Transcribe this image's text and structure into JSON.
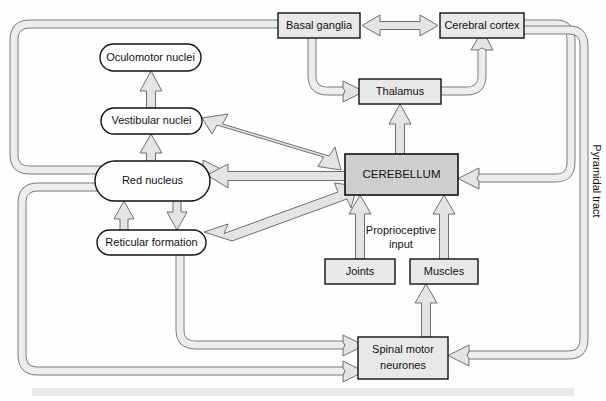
{
  "diagram": {
    "background": "#fefefe",
    "bottom_band_color": "#e9e9e9",
    "node_fill_box": "#e8e8e8",
    "node_fill_oval": "#fefefe",
    "cerebellum_fill": "#d0d0d0",
    "arrow_fill": "#e0e0e0",
    "arrow_stroke": "#6b6b6b",
    "stroke": "#1a1a1a"
  },
  "nodes": {
    "basal_ganglia": {
      "label": "Basal ganglia",
      "shape": "rect",
      "x": 278,
      "y": 13,
      "w": 82,
      "h": 25
    },
    "cerebral_cortex": {
      "label": "Cerebral cortex",
      "shape": "rect",
      "x": 440,
      "y": 13,
      "w": 84,
      "h": 25
    },
    "thalamus": {
      "label": "Thalamus",
      "shape": "rect",
      "x": 359,
      "y": 79,
      "w": 82,
      "h": 25
    },
    "cerebellum": {
      "label": "CEREBELLUM",
      "shape": "rect",
      "x": 345,
      "y": 154,
      "w": 113,
      "h": 41
    },
    "oculomotor_nuclei": {
      "label": "Oculomotor nuclei",
      "shape": "oval",
      "x": 100,
      "y": 44,
      "w": 101,
      "h": 27
    },
    "vestibular_nuclei": {
      "label": "Vestibular nuclei",
      "shape": "oval",
      "x": 101,
      "y": 108,
      "w": 101,
      "h": 26
    },
    "red_nucleus": {
      "label": "Red nucleus",
      "shape": "oval",
      "x": 95,
      "y": 161,
      "w": 115,
      "h": 40
    },
    "reticular_formation": {
      "label": "Reticular formation",
      "shape": "oval",
      "x": 97,
      "y": 230,
      "w": 109,
      "h": 25
    },
    "joints": {
      "label": "Joints",
      "shape": "rect",
      "x": 325,
      "y": 259,
      "w": 70,
      "h": 25
    },
    "muscles": {
      "label": "Muscles",
      "shape": "rect",
      "x": 410,
      "y": 259,
      "w": 68,
      "h": 25
    },
    "spinal_motor_neurones": {
      "label_line1": "Spinal motor",
      "label_line2": "neurones",
      "shape": "rect",
      "x": 358,
      "y": 337,
      "w": 90,
      "h": 42
    }
  },
  "free_labels": {
    "proprioceptive_input_line1": "Proprioceptive",
    "proprioceptive_input_line2": "input",
    "pyramidal_tract": "Pyramidal tract"
  },
  "connections": [
    {
      "name": "basal-ganglia-to-cerebral-cortex",
      "from": "Basal ganglia",
      "to": "Cerebral cortex",
      "type": "bidirectional-arrow"
    },
    {
      "name": "basal-ganglia-to-thalamus",
      "from": "Basal ganglia",
      "to": "Thalamus",
      "type": "arrow"
    },
    {
      "name": "thalamus-to-cerebral-cortex",
      "from": "Thalamus",
      "to": "Cerebral cortex",
      "type": "arrow"
    },
    {
      "name": "cerebellum-to-thalamus",
      "from": "CEREBELLUM",
      "to": "Thalamus",
      "type": "arrow"
    },
    {
      "name": "cerebral-cortex-to-cerebellum",
      "from": "Cerebral cortex",
      "to": "CEREBELLUM",
      "type": "arrow"
    },
    {
      "name": "cerebral-cortex-to-spinal-motor-neurones",
      "from": "Cerebral cortex",
      "to": "Spinal motor neurones",
      "type": "arrow",
      "label": "Pyramidal tract"
    },
    {
      "name": "cerebellum-to-vestibular-nuclei",
      "from": "CEREBELLUM",
      "to": "Vestibular nuclei",
      "type": "bidirectional-arrow"
    },
    {
      "name": "cerebellum-to-red-nucleus",
      "from": "CEREBELLUM",
      "to": "Red nucleus",
      "type": "arrow"
    },
    {
      "name": "cerebellum-to-reticular-formation",
      "from": "CEREBELLUM",
      "to": "Reticular formation",
      "type": "arrow"
    },
    {
      "name": "vestibular-nuclei-to-oculomotor-nuclei",
      "from": "Vestibular nuclei",
      "to": "Oculomotor nuclei",
      "type": "arrow"
    },
    {
      "name": "red-nucleus-to-vestibular-nuclei",
      "from": "Red nucleus",
      "to": "Vestibular nuclei",
      "type": "arrow"
    },
    {
      "name": "reticular-formation-to-red-nucleus",
      "from": "Reticular formation",
      "to": "Red nucleus",
      "type": "arrow"
    },
    {
      "name": "red-nucleus-to-reticular-formation",
      "from": "Red nucleus",
      "to": "Reticular formation",
      "type": "arrow"
    },
    {
      "name": "basal-ganglia-loop-to-red-nucleus",
      "from": "Basal ganglia",
      "to": "Red nucleus",
      "type": "arrow"
    },
    {
      "name": "joints-to-cerebellum",
      "from": "Joints",
      "to": "CEREBELLUM",
      "type": "arrow",
      "label": "Proprioceptive input"
    },
    {
      "name": "muscles-to-cerebellum",
      "from": "Muscles",
      "to": "CEREBELLUM",
      "type": "arrow",
      "label": "Proprioceptive input"
    },
    {
      "name": "spinal-motor-neurones-to-muscles",
      "from": "Spinal motor neurones",
      "to": "Muscles",
      "type": "arrow"
    },
    {
      "name": "reticular-formation-to-spinal-motor-neurones",
      "from": "Reticular formation",
      "to": "Spinal motor neurones",
      "type": "arrow"
    },
    {
      "name": "red-nucleus-loop-to-spinal-motor-neurones",
      "from": "Red nucleus",
      "to": "Spinal motor neurones",
      "type": "arrow"
    }
  ]
}
